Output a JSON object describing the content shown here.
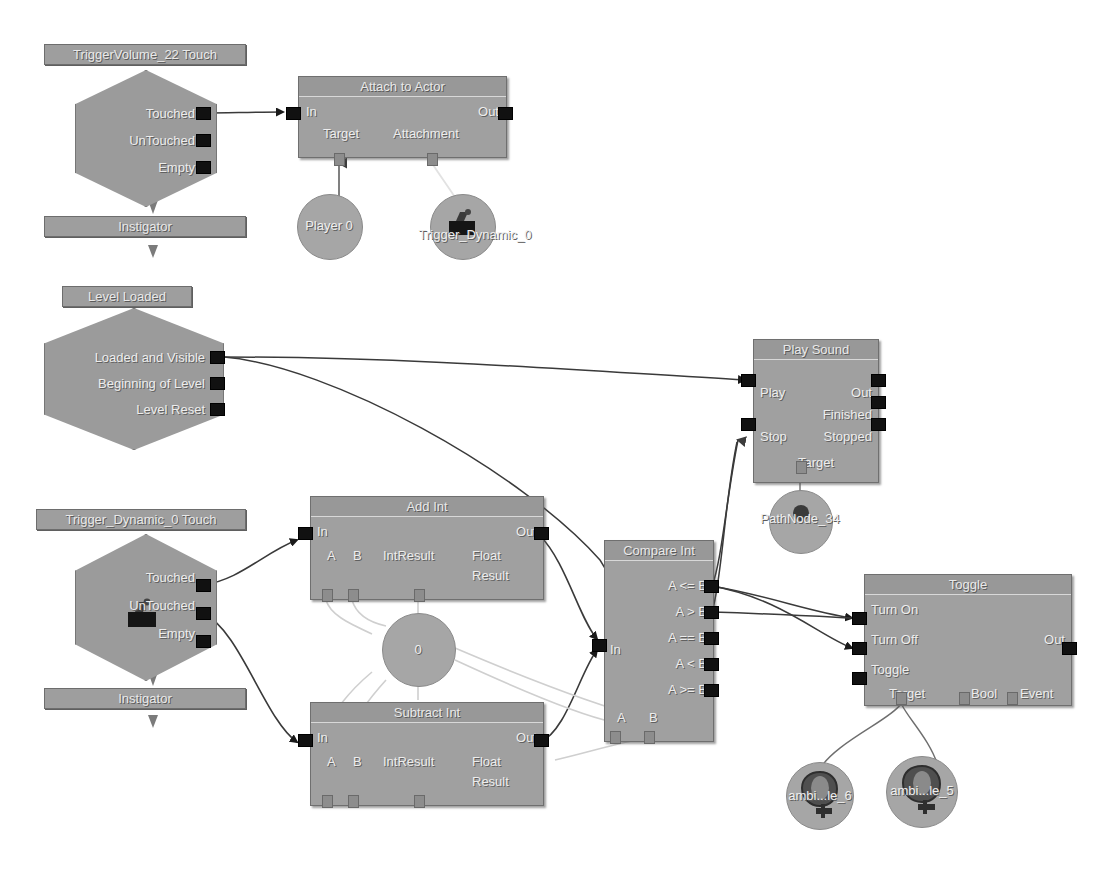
{
  "canvas": {
    "background": "#ffffff",
    "node_body_color": "#a0a0a0",
    "node_title_color": "#989898",
    "plug_color": "#111111",
    "wire_color": "#3a3a3a",
    "variable_wire_color": "#cccccc"
  },
  "nodes": {
    "trigger_volume_touch": {
      "caption": "TriggerVolume_22 Touch",
      "outputs": [
        "Touched",
        "UnTouched",
        "Empty"
      ],
      "variable_label": "Instigator"
    },
    "attach_to_actor": {
      "title": "Attach to Actor",
      "input": "In",
      "output": "Out",
      "var_target": "Target",
      "var_attachment": "Attachment"
    },
    "player_var": {
      "label": "Player 0"
    },
    "trigger_dynamic_var": {
      "label": "Trigger_Dynamic_0",
      "icon": "trigger-icon"
    },
    "level_loaded": {
      "caption": "Level Loaded",
      "outputs": [
        "Loaded and Visible",
        "Beginning of Level",
        "Level Reset"
      ]
    },
    "play_sound": {
      "title": "Play Sound",
      "inputs": [
        "Play",
        "Stop"
      ],
      "outputs": [
        "Out",
        "Finished",
        "Stopped"
      ],
      "var_target": "Target"
    },
    "pathnode_var": {
      "label": "PathNode_34",
      "icon": "pathnode-icon"
    },
    "trigger_dynamic_touch": {
      "caption": "Trigger_Dynamic_0 Touch",
      "outputs": [
        "Touched",
        "UnTouched",
        "Empty"
      ],
      "variable_label": "Instigator",
      "icon": "trigger-icon"
    },
    "add_int": {
      "title": "Add Int",
      "input": "In",
      "output": "Out",
      "var_a": "A",
      "var_b": "B",
      "var_int_result": "IntResult",
      "var_float_result_1": "Float",
      "var_float_result_2": "Result"
    },
    "subtract_int": {
      "title": "Subtract Int",
      "input": "In",
      "output": "Out",
      "var_a": "A",
      "var_b": "B",
      "var_int_result": "IntResult",
      "var_float_result_1": "Float",
      "var_float_result_2": "Result"
    },
    "int_zero_var": {
      "label": "0"
    },
    "compare_int": {
      "title": "Compare Int",
      "input": "In",
      "outputs": [
        "A <= B",
        "A > B",
        "A == B",
        "A < B",
        "A >= B"
      ],
      "var_a": "A",
      "var_b": "B"
    },
    "toggle": {
      "title": "Toggle",
      "inputs": [
        "Turn On",
        "Turn Off",
        "Toggle"
      ],
      "output": "Out",
      "var_target": "Target",
      "var_bool": "Bool",
      "var_event": "Event"
    },
    "ambient_6": {
      "label": "ambi...le_6",
      "icon": "speaker-icon"
    },
    "ambient_5": {
      "label": "ambi...le_5",
      "icon": "speaker-icon"
    }
  }
}
